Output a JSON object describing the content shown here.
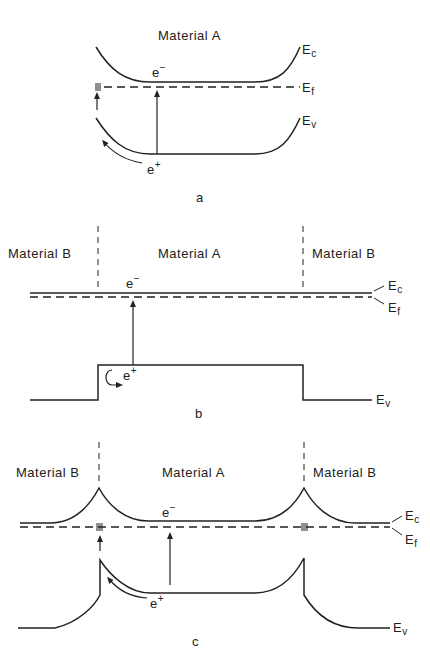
{
  "panels": [
    {
      "id": "a",
      "caption": "a",
      "regions": [
        "Material A"
      ],
      "electron_label": "e",
      "electron_sign": "−",
      "hole_label": "e",
      "hole_sign": "+",
      "band_labels": {
        "conduction": "E",
        "conduction_sub": "c",
        "fermi": "E",
        "fermi_sub": "f",
        "valence": "E",
        "valence_sub": "v"
      }
    },
    {
      "id": "b",
      "caption": "b",
      "regions": [
        "Material B",
        "Material A",
        "Material B"
      ],
      "electron_label": "e",
      "electron_sign": "−",
      "hole_label": "e",
      "hole_sign": "+",
      "band_labels": {
        "conduction": "E",
        "conduction_sub": "c",
        "fermi": "E",
        "fermi_sub": "f",
        "valence": "E",
        "valence_sub": "v"
      }
    },
    {
      "id": "c",
      "caption": "c",
      "regions": [
        "Material B",
        "Material A",
        "Material B"
      ],
      "electron_label": "e",
      "electron_sign": "−",
      "hole_label": "e",
      "hole_sign": "+",
      "band_labels": {
        "conduction": "E",
        "conduction_sub": "c",
        "fermi": "E",
        "fermi_sub": "f",
        "valence": "E",
        "valence_sub": "v"
      }
    }
  ]
}
